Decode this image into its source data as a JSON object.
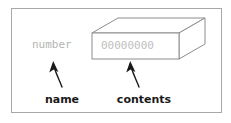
{
  "figure": {
    "kind": "variable-diagram",
    "frame": {
      "border_color": "#a8a8a8"
    },
    "variable_name": "number",
    "variable_name_color": "#b4b4b4",
    "contents_value": "00000000",
    "contents_color": "#c0c0c0",
    "box": {
      "line_color": "#8c8c8c",
      "face_color": "#ffffff"
    },
    "annotations": [
      {
        "id": "name",
        "label": "name",
        "points_to": "variable_name"
      },
      {
        "id": "contents",
        "label": "contents",
        "points_to": "contents_value"
      }
    ],
    "label_color": "#1a1a1a",
    "arrow_color": "#1a1a1a"
  }
}
